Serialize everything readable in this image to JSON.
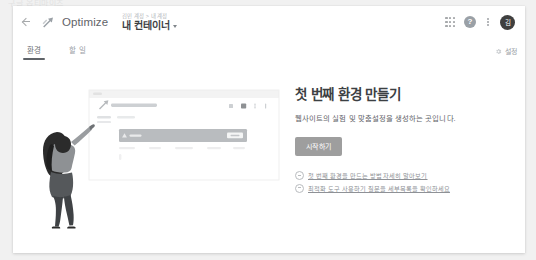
{
  "top_strip_text": "구글 옵티마이즈",
  "appbar": {
    "back_label": "뒤로",
    "brand": "Optimize",
    "breadcrumb": "김민 계정 > 내 계정",
    "container_name": "내 컨테이너",
    "apps_label": "Google 앱",
    "help_label": "?",
    "more_label": "더보기",
    "avatar_initials": "김"
  },
  "tabs": [
    {
      "label": "환경",
      "active": true
    },
    {
      "label": "할 일",
      "active": false
    }
  ],
  "tabbar_right": {
    "icon": "gear-icon",
    "label": "설정"
  },
  "illustration": {
    "mock_window_title": "My first experience",
    "mock_card_label": "Card",
    "mock_card_button": "버튼"
  },
  "cta": {
    "title": "첫 번째 환경 만들기",
    "subtitle": "웹사이트의 실험 및 맞춤설정을 생성하는 곳입니다.",
    "button": "시작하기",
    "links": [
      "첫 번째 환경을 만드는 방법 자세히 알아보기",
      "최적화 도구 사용하기 질문을 세부목록을 확인하세요"
    ]
  },
  "colors": {
    "page_bg": "#f1f1f1",
    "card_bg": "#ffffff",
    "text_primary": "#3c4043",
    "text_secondary": "#5f6368",
    "text_muted": "#9aa0a6",
    "button_bg": "#9e9e9e",
    "avatar_bg": "#3f3f3f"
  }
}
